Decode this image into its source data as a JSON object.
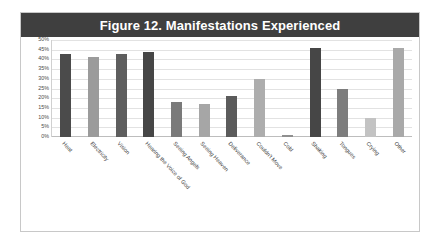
{
  "figure": {
    "title": "Figure 12. Manifestations Experienced",
    "title_bar_color": "#3f3f3f",
    "frame_border_color": "#c8c8c8",
    "background": "#ffffff"
  },
  "chart_data": {
    "type": "bar",
    "title": "Figure 12. Manifestations Experienced",
    "xlabel": "",
    "ylabel": "",
    "ylim": [
      0,
      50
    ],
    "ytick_labels": [
      "50%",
      "45%",
      "40%",
      "35%",
      "30%",
      "25%",
      "20%",
      "15%",
      "10%",
      "5%",
      "0%"
    ],
    "ytick_values": [
      50,
      45,
      40,
      35,
      30,
      25,
      20,
      15,
      10,
      5,
      0
    ],
    "grid": true,
    "legend": "none",
    "value_suffix": "%",
    "categories": [
      "Heat",
      "Electricity",
      "Vision",
      "Hearing the Voice of God",
      "Seeing Angels",
      "Seeing Heaven",
      "Deliverance",
      "Couldn't Move",
      "Cold",
      "Shaking",
      "Tongues",
      "Crying",
      "Other"
    ],
    "values": [
      43,
      41,
      43,
      44,
      18,
      17,
      21,
      30,
      1,
      46,
      25,
      10,
      46
    ],
    "bar_colors": [
      "#4b4b4b",
      "#9b9b9b",
      "#5e5e5e",
      "#464646",
      "#7a7a7a",
      "#a6a6a6",
      "#5b5b5b",
      "#adadad",
      "#8f8f8f",
      "#464646",
      "#7d7d7d",
      "#c3c3c3",
      "#a9a9a9"
    ]
  }
}
